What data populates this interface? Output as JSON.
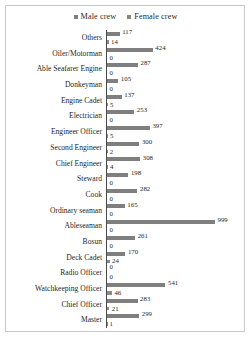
{
  "chart_data": {
    "type": "bar",
    "orientation": "horizontal",
    "title": "",
    "xlabel": "",
    "ylabel": "",
    "grid": false,
    "legend_position": "top-center",
    "xlim": [
      0,
      999
    ],
    "value_labels": true,
    "categories": [
      "Others",
      "Oiler/Motorman",
      "Able Seafarer Engine",
      "Donkeyman",
      "Engine Cadet",
      "Electrician",
      "Engineer Officer",
      "Second Engineer",
      "Chief Engineer",
      "Steward",
      "Cook",
      "Ordinary seaman",
      "Ableseaman",
      "Bosun",
      "Deck Cadet",
      "Radio Officer",
      "Watchkeeping Officer",
      "Chief Officer",
      "Master"
    ],
    "series": [
      {
        "name": "Male crew",
        "color": "#7f7f7f",
        "values": [
          117,
          424,
          287,
          105,
          137,
          253,
          397,
          300,
          308,
          198,
          282,
          165,
          999,
          261,
          170,
          0,
          541,
          283,
          299
        ]
      },
      {
        "name": "Female crew",
        "color": "#8a8a8a",
        "values": [
          14,
          0,
          0,
          0,
          5,
          0,
          5,
          2,
          4,
          0,
          0,
          0,
          0,
          0,
          24,
          0,
          46,
          21,
          1
        ]
      }
    ]
  },
  "legend": {
    "items": [
      {
        "label": "Male crew"
      },
      {
        "label": "Female crew"
      }
    ]
  }
}
